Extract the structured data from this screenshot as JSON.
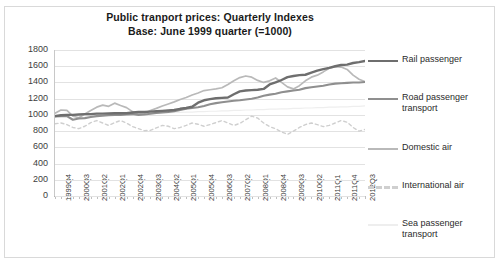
{
  "chart_data": {
    "type": "line",
    "title": "Public tranport prices: Quarterly Indexes",
    "subtitle": "Base: June 1999 quarter (=1000)",
    "xlabel": "",
    "ylabel": "",
    "ylim": [
      0,
      1800
    ],
    "ytick_step": 200,
    "yticks": [
      "1800",
      "1600",
      "1400",
      "1200",
      "1000",
      "800",
      "600",
      "400",
      "200",
      "0"
    ],
    "grid": true,
    "legend_position": "right",
    "x": [
      "1999Q3",
      "1999Q4",
      "2000Q1",
      "2000Q2",
      "2000Q3",
      "2000Q4",
      "2001Q1",
      "2001Q2",
      "2001Q3",
      "2001Q4",
      "2002Q1",
      "2002Q2",
      "2002Q3",
      "2002Q4",
      "2003Q1",
      "2003Q2",
      "2003Q3",
      "2003Q4",
      "2004Q1",
      "2004Q2",
      "2004Q3",
      "2004Q4",
      "2005Q1",
      "2005Q2",
      "2005Q3",
      "2005Q4",
      "2006Q1",
      "2006Q2",
      "2006Q3",
      "2006Q4",
      "2007Q1",
      "2007Q2",
      "2007Q3",
      "2007Q4",
      "2008Q1",
      "2008Q2",
      "2008Q3",
      "2008Q4",
      "2009Q1",
      "2009Q2",
      "2009Q3",
      "2009Q4",
      "2010Q1",
      "2010Q2",
      "2010Q3",
      "2010Q4",
      "2011Q1",
      "2011Q2",
      "2011Q3",
      "2011Q4",
      "2012Q1",
      "2012Q2",
      "2012Q3"
    ],
    "xtick_labels": [
      "1999Q4",
      "2000Q3",
      "2001Q2",
      "2002Q1",
      "2002Q4",
      "2003Q3",
      "2004Q2",
      "2005Q1",
      "2005Q4",
      "2006Q3",
      "2007Q2",
      "2008Q1",
      "2008Q4",
      "2009Q3",
      "2010Q2",
      "2011Q1",
      "2011Q4",
      "2012Q3"
    ],
    "xtick_indices": [
      1,
      4,
      7,
      10,
      13,
      16,
      19,
      22,
      25,
      28,
      31,
      34,
      37,
      40,
      43,
      46,
      49,
      52
    ],
    "series": [
      {
        "name": "Rail passenger",
        "color": "#6e6e6e",
        "width": 2.4,
        "dash": "none",
        "values": [
          985,
          995,
          1000,
          1000,
          1005,
          1010,
          1010,
          1015,
          1015,
          1018,
          1020,
          1020,
          1020,
          1030,
          1035,
          1035,
          1040,
          1045,
          1050,
          1055,
          1060,
          1075,
          1085,
          1100,
          1150,
          1180,
          1195,
          1205,
          1210,
          1215,
          1255,
          1290,
          1300,
          1305,
          1310,
          1320,
          1375,
          1400,
          1430,
          1465,
          1480,
          1490,
          1495,
          1520,
          1545,
          1565,
          1580,
          1600,
          1615,
          1620,
          1640,
          1650,
          1665
        ]
      },
      {
        "name": "Road passenger transport",
        "color": "#8f8f8f",
        "width": 2.1,
        "dash": "none",
        "values": [
          980,
          985,
          985,
          940,
          955,
          960,
          975,
          985,
          990,
          995,
          1000,
          1000,
          1005,
          1010,
          1000,
          1005,
          1015,
          1025,
          1030,
          1035,
          1045,
          1060,
          1075,
          1085,
          1095,
          1110,
          1130,
          1145,
          1155,
          1165,
          1175,
          1180,
          1190,
          1200,
          1215,
          1235,
          1250,
          1260,
          1280,
          1290,
          1300,
          1310,
          1330,
          1340,
          1350,
          1360,
          1375,
          1385,
          1390,
          1395,
          1400,
          1400,
          1405
        ]
      },
      {
        "name": "Domestic air",
        "color": "#b9b9b9",
        "width": 1.7,
        "dash": "none",
        "values": [
          1020,
          1060,
          1055,
          985,
          965,
          1010,
          1055,
          1095,
          1120,
          1105,
          1145,
          1115,
          1090,
          1040,
          1010,
          1020,
          1055,
          1080,
          1110,
          1135,
          1160,
          1190,
          1215,
          1245,
          1270,
          1300,
          1310,
          1320,
          1335,
          1375,
          1420,
          1460,
          1480,
          1465,
          1425,
          1400,
          1420,
          1455,
          1400,
          1345,
          1320,
          1360,
          1420,
          1465,
          1490,
          1530,
          1575,
          1595,
          1590,
          1560,
          1490,
          1440,
          1410
        ]
      },
      {
        "name": "International air",
        "color": "#cfcfcf",
        "width": 1.4,
        "dash": "3,3",
        "values": [
          890,
          900,
          880,
          845,
          830,
          860,
          905,
          930,
          900,
          870,
          905,
          930,
          900,
          855,
          830,
          805,
          810,
          840,
          870,
          860,
          830,
          845,
          870,
          900,
          885,
          860,
          880,
          905,
          930,
          900,
          870,
          895,
          940,
          985,
          960,
          900,
          855,
          830,
          790,
          760,
          800,
          845,
          880,
          900,
          880,
          855,
          870,
          900,
          930,
          910,
          845,
          800,
          820
        ]
      },
      {
        "name": "Sea passenger transport",
        "color": "#eeeeee",
        "width": 1.2,
        "dash": "none",
        "values": [
          1000,
          1000,
          1000,
          1000,
          1000,
          1005,
          1005,
          1005,
          1010,
          1010,
          1010,
          1010,
          1015,
          1015,
          1015,
          1020,
          1020,
          1020,
          1025,
          1025,
          1030,
          1030,
          1035,
          1035,
          1040,
          1040,
          1045,
          1045,
          1050,
          1050,
          1055,
          1055,
          1060,
          1060,
          1065,
          1065,
          1070,
          1070,
          1075,
          1075,
          1080,
          1080,
          1085,
          1085,
          1090,
          1090,
          1095,
          1095,
          1100,
          1100,
          1105,
          1105,
          1110
        ]
      }
    ]
  }
}
